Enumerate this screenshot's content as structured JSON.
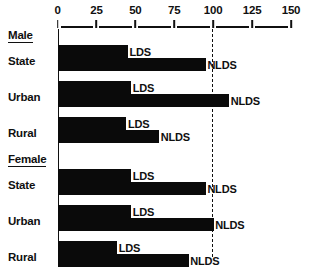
{
  "chart_data": {
    "type": "bar",
    "orientation": "horizontal",
    "title": "",
    "xlabel": "",
    "ylabel": "",
    "xlim": [
      0,
      150
    ],
    "grid": false,
    "legend": "inline-labels",
    "reference_line": 100,
    "axis": {
      "ticks": [
        0,
        25,
        50,
        75,
        100,
        125,
        150
      ],
      "tick_labels": [
        "0",
        "25",
        "50",
        "75",
        "100",
        "125",
        "150"
      ]
    },
    "series": [
      {
        "name": "LDS",
        "values": [
          45,
          47,
          44,
          47,
          47,
          38
        ]
      },
      {
        "name": "NLDS",
        "values": [
          95,
          110,
          65,
          95,
          100,
          84
        ]
      }
    ],
    "groups": [
      {
        "title": "Male",
        "categories": [
          "State",
          "Urban",
          "Rural"
        ],
        "bars": [
          {
            "category": "State",
            "lds": 45,
            "lds_label": "LDS",
            "nlds": 95,
            "nlds_label": "NLDS"
          },
          {
            "category": "Urban",
            "lds": 47,
            "lds_label": "LDS",
            "nlds": 110,
            "nlds_label": "NLDS"
          },
          {
            "category": "Rural",
            "lds": 44,
            "lds_label": "LDS",
            "nlds": 65,
            "nlds_label": "NLDS"
          }
        ]
      },
      {
        "title": "Female",
        "categories": [
          "State",
          "Urban",
          "Rural"
        ],
        "bars": [
          {
            "category": "State",
            "lds": 47,
            "lds_label": "LDS",
            "nlds": 95,
            "nlds_label": "NLDS"
          },
          {
            "category": "Urban",
            "lds": 47,
            "lds_label": "LDS",
            "nlds": 100,
            "nlds_label": "NLDS"
          },
          {
            "category": "Rural",
            "lds": 38,
            "lds_label": "LDS",
            "nlds": 84,
            "nlds_label": "NLDS"
          }
        ]
      }
    ],
    "colors": {
      "bar": "#0a0a0a",
      "axis": "#101010",
      "background": "#ffffff"
    }
  }
}
